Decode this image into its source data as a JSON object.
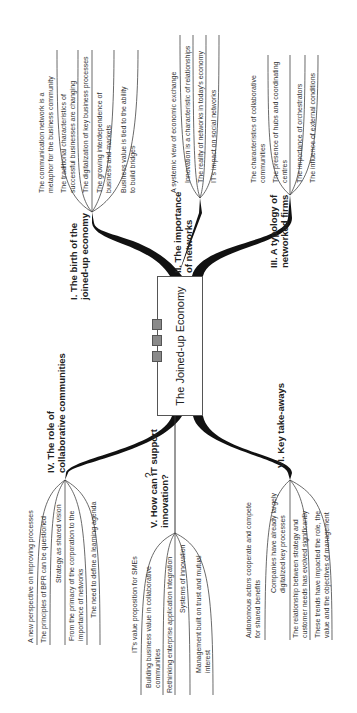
{
  "central": {
    "title": "The Joined-up Economy"
  },
  "branches": [
    {
      "label_line1": "I. The birth of the",
      "label_line2": "joined-up economy",
      "items": [
        "The communication network is a",
        "metaphor for the business community",
        "The traditional characteristics of",
        "successful businesses are changing",
        "The digitalization of key business processes",
        "The growing interdependence of",
        "business and markets",
        "Business value is tied to the ability",
        "to build bridges"
      ]
    },
    {
      "label_line1": "II. The importance",
      "label_line2": "of networks",
      "items": [
        "A systemic view of economic exchange",
        "Innovation is a characteristic of relationships",
        "The reality of networks in today's economy",
        "IT's impact on social networks"
      ]
    },
    {
      "label_line1": "III. A typology of",
      "label_line2": "networked firms",
      "items": [
        "The characteristics of collaborative",
        "communities",
        "The presence of hubs and coordinating",
        "centres",
        "The importance of orchestrators",
        "The influence of external conditions"
      ]
    },
    {
      "label_line1": "IV. The role of",
      "label_line2": "collaborative communities",
      "items": [
        "A new perspective on improving processes",
        "The principles of BPR can be questioned",
        "Strategy as shared vision",
        "From the primacy of the corporation to the",
        "importance of networks",
        "The need to define a learning agenda"
      ]
    },
    {
      "label_line1": "V. How can IT support",
      "label_line2": "innovation?",
      "icon": "?",
      "items": [
        "IT's value proposition for SMEs",
        "Building business value in collaborative",
        "communities",
        "Rethinking enterprise application integration",
        "Systems of innovation",
        "Management built on trust and mutual",
        "interest"
      ]
    },
    {
      "label_line1": "VI. Key take-aways",
      "label_line2": "",
      "items": [
        "Autonomous actors cooperate and compete",
        "for shared benefits",
        "Companies have already largely",
        "digitalized key processes",
        "The relationship between strategy and",
        "customer needs has evolved significantly",
        "These trends have impacted the role, the",
        "value and the objectives of management"
      ]
    }
  ]
}
